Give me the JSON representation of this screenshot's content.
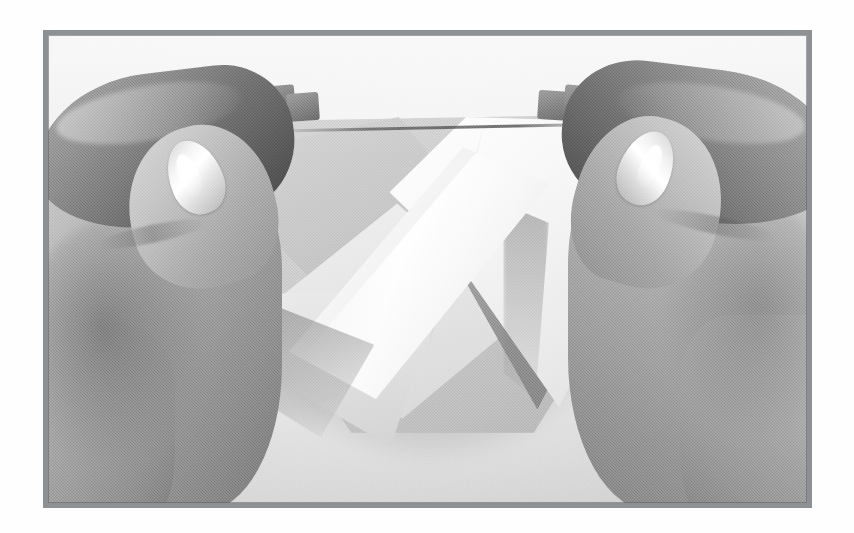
{
  "page": {
    "background_color": "#ffffff",
    "content_type": "photograph",
    "color_mode": "black-and-white"
  },
  "frame": {
    "name": "photo-frame",
    "border_color": "#8e9194",
    "border_width_px": 5,
    "left_px": 43,
    "top_px": 30,
    "width_px": 769,
    "height_px": 478
  },
  "photograph": {
    "subject": "Two hands folding a square sheet of paper (origami step)",
    "orientation": "landscape",
    "backdrop": {
      "name": "linen-backdrop",
      "description": "Light textured canvas / linen cloth surface",
      "color": "#e6e6e3"
    },
    "lighting": {
      "direction": "upper-left",
      "highlight_color": "#ffffff",
      "shadow_color": "#6f6f6d"
    },
    "elements": [
      {
        "name": "origami-paper-base",
        "label": "Gray square base sheet",
        "color": "#c2c2bf"
      },
      {
        "name": "origami-white-flap-right",
        "label": "Large white folded triangular flap (right)",
        "color": "#f6f6f5"
      },
      {
        "name": "origami-white-band",
        "label": "Raised white diagonal band across the center",
        "color": "#ffffff"
      },
      {
        "name": "origami-inner-diamond",
        "label": "Pale inner diamond panel",
        "color": "#e3e3e1"
      },
      {
        "name": "origami-pocket-shadow",
        "label": "Dark triangular pocket shadow",
        "color": "#86868 4"
      },
      {
        "name": "origami-lower-point",
        "label": "Lower pale point of the model",
        "color": "#dedede"
      },
      {
        "name": "hand-left",
        "label": "Left hand gripping the near-left fold",
        "skin_tone": "#a0a09d",
        "parts": [
          "index-finger",
          "thumb",
          "fingernail",
          "palm",
          "wrist"
        ]
      },
      {
        "name": "hand-right",
        "label": "Right hand gripping the near-right fold",
        "skin_tone": "#a3a3a0",
        "parts": [
          "index-finger",
          "thumb",
          "fingernail",
          "palm",
          "wrist"
        ]
      },
      {
        "name": "paper-tabs-top",
        "label": "Small gray paper tabs protruding at the top edge",
        "count": 4,
        "color": "#6f6f6d"
      }
    ]
  }
}
